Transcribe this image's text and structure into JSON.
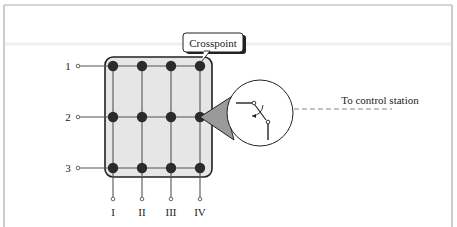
{
  "diagram": {
    "type": "crossbar-switch",
    "callout": {
      "label": "Crosspoint"
    },
    "control_link": {
      "label": "To control station"
    },
    "rows": [
      {
        "label": "1",
        "y": 66
      },
      {
        "label": "2",
        "y": 117
      },
      {
        "label": "3",
        "y": 168
      }
    ],
    "columns": [
      {
        "label": "I",
        "x": 113
      },
      {
        "label": "II",
        "x": 142
      },
      {
        "label": "III",
        "x": 171
      },
      {
        "label": "IV",
        "x": 200
      }
    ],
    "colors": {
      "frame": "#bdbdbd",
      "matrix_fill": "#e6e6e6",
      "matrix_border": "#222222",
      "crosspoint": "#2b2b2b",
      "line": "#555555",
      "magnifier_cone": "#9a9a9a",
      "dashed_line": "#888888"
    }
  }
}
